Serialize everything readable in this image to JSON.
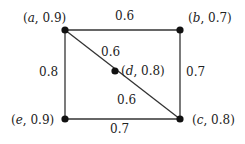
{
  "diagram": {
    "type": "weighted-graph",
    "nodes": [
      {
        "id": "a",
        "value": "0.9",
        "x": 65,
        "y": 30,
        "label_open": "(",
        "label_name": "a",
        "label_rest": ", 0.9)"
      },
      {
        "id": "b",
        "value": "0.7",
        "x": 180,
        "y": 30,
        "label_open": "(",
        "label_name": "b",
        "label_rest": ", 0.7)"
      },
      {
        "id": "d",
        "value": "0.8",
        "x": 115,
        "y": 71,
        "label_open": "(",
        "label_name": "d",
        "label_rest": ", 0.8)"
      },
      {
        "id": "e",
        "value": "0.9",
        "x": 65,
        "y": 119,
        "label_open": "(",
        "label_name": "e",
        "label_rest": ", 0.9)"
      },
      {
        "id": "c",
        "value": "0.8",
        "x": 180,
        "y": 119,
        "label_open": "(",
        "label_name": "c",
        "label_rest": ", 0.8)"
      }
    ],
    "edges": [
      {
        "from": "a",
        "to": "b",
        "weight": "0.6"
      },
      {
        "from": "a",
        "to": "d",
        "weight": "0.6"
      },
      {
        "from": "d",
        "to": "c",
        "weight": "0.6"
      },
      {
        "from": "a",
        "to": "e",
        "weight": "0.8"
      },
      {
        "from": "b",
        "to": "c",
        "weight": "0.7"
      },
      {
        "from": "e",
        "to": "c",
        "weight": "0.7"
      }
    ]
  }
}
